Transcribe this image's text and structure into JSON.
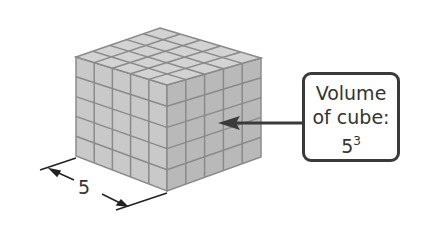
{
  "diagram": {
    "type": "cube-of-unit-cubes",
    "units_per_edge": 5,
    "dimension_label": "5",
    "callout": {
      "line1": "Volume",
      "line2": "of cube:",
      "base": "5",
      "exponent": "3"
    },
    "colors": {
      "face_left": "#c9c9c9",
      "face_right": "#b9b9b9",
      "face_top": "#d3d3d3",
      "grid": "#8a8a8a",
      "ink": "#333333"
    }
  }
}
